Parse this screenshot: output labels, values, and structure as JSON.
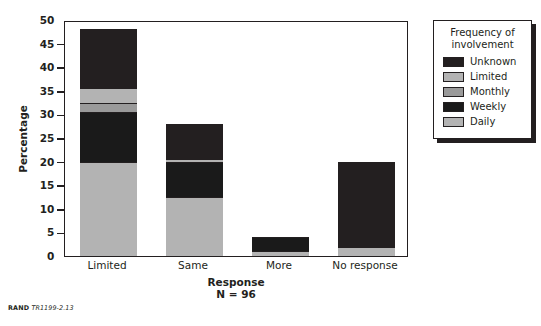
{
  "chart_data": {
    "type": "bar",
    "stacked": true,
    "title": "",
    "xlabel": "Response",
    "ylabel": "Percentage",
    "annotation": "N = 96",
    "ylim": [
      0,
      50
    ],
    "ytick_step": 5,
    "yticks": [
      "0",
      "5",
      "10",
      "15",
      "20",
      "25",
      "30",
      "35",
      "40",
      "45",
      "50"
    ],
    "grid": false,
    "legend_position": "right-outside",
    "categories": [
      "Limited",
      "Same",
      "More",
      "No response"
    ],
    "series": [
      {
        "name": "Daily",
        "color": "#b3b3b3",
        "values": [
          20,
          12.5,
          1,
          2
        ]
      },
      {
        "name": "Weekly",
        "color": "#1a1a1a",
        "values": [
          10.5,
          7.5,
          3,
          0
        ]
      },
      {
        "name": "Monthly",
        "color": "#9a9a9a",
        "values": [
          2,
          0,
          0,
          0
        ]
      },
      {
        "name": "Limited",
        "color": "#b3b3b3",
        "values": [
          3,
          0.5,
          0,
          0
        ]
      },
      {
        "name": "Unknown",
        "color": "#231f20",
        "values": [
          12.5,
          7.5,
          0,
          18
        ]
      }
    ],
    "totals": [
      48,
      28,
      4,
      20
    ]
  },
  "legend": {
    "title": "Frequency of involvement",
    "title_line1": "Frequency of",
    "title_line2": "involvement",
    "entries": [
      {
        "label": "Unknown",
        "color": "#231f20"
      },
      {
        "label": "Limited",
        "color": "#b3b3b3"
      },
      {
        "label": "Monthly",
        "color": "#9a9a9a"
      },
      {
        "label": "Weekly",
        "color": "#1a1a1a"
      },
      {
        "label": "Daily",
        "color": "#b3b3b3"
      }
    ]
  },
  "footer": {
    "brand": "RAND",
    "figure": "TR1199-2.13"
  }
}
